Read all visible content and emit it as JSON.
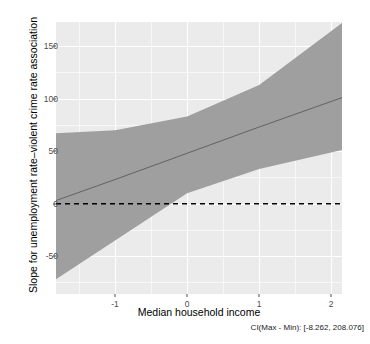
{
  "chart_data": {
    "type": "line",
    "title": "",
    "xlabel": "Median household income",
    "ylabel": "Slope for unemployment rate–violent crime rate association",
    "caption": "CI(Max - Min): [-8.262, 208.076]",
    "xlim": [
      -1.82,
      2.15
    ],
    "ylim": [
      -86,
      173
    ],
    "x_ticks": [
      -1,
      0,
      1,
      2
    ],
    "x_tick_labels": [
      "-1",
      "0",
      "1",
      "2"
    ],
    "y_ticks": [
      -50,
      0,
      50,
      100,
      150
    ],
    "y_tick_labels": [
      "-50",
      "0",
      "50",
      "100",
      "150"
    ],
    "grid": true,
    "legend": null,
    "panel_background": "#ebebeb",
    "gridline_color": "#ffffff",
    "ribbon_color": "#9f9f9f",
    "line_color": "#5a5a5a",
    "reference_line_color": "#000000",
    "series": [
      {
        "name": "fit",
        "style": "solid",
        "x": [
          -1.82,
          -1.0,
          0.0,
          1.0,
          2.15
        ],
        "values": [
          3.0,
          23.0,
          48.0,
          73.0,
          101.0
        ]
      },
      {
        "name": "ci_upper",
        "style": "ribbon-upper",
        "x": [
          -1.82,
          -1.0,
          0.0,
          1.0,
          2.15
        ],
        "values": [
          67.0,
          70.0,
          83.0,
          113.0,
          172.0
        ]
      },
      {
        "name": "ci_lower",
        "style": "ribbon-lower",
        "x": [
          -1.82,
          -1.0,
          0.0,
          1.0,
          2.15
        ],
        "values": [
          -72.0,
          -35.0,
          10.0,
          33.0,
          51.0
        ]
      },
      {
        "name": "zero_reference",
        "style": "dashed",
        "x": [
          -1.82,
          2.15
        ],
        "values": [
          0.0,
          0.0
        ]
      }
    ]
  },
  "axis": {
    "x_title": "Median household income",
    "y_title": "Slope for unemployment rate–violent crime rate association"
  },
  "footer": {
    "ci_text": "CI(Max - Min): [-8.262, 208.076]"
  }
}
